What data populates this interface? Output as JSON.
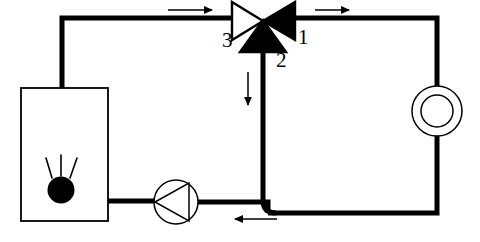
{
  "diagram": {
    "background_color": "#ffffff",
    "line_color": "#000000",
    "pipe_width_px": 5,
    "thin_line_width_px": 1.4,
    "labels": [
      {
        "id": "port-1",
        "text": "1",
        "x": 298,
        "y": 27,
        "meaning": "valve port 1 (supply from circuit)"
      },
      {
        "id": "port-2",
        "text": "2",
        "x": 276,
        "y": 50,
        "meaning": "valve port 2 (bypass / return branch)"
      },
      {
        "id": "port-3",
        "text": "3",
        "x": 222,
        "y": 30,
        "meaning": "valve port 3 (outlet to boiler)"
      }
    ],
    "components": [
      {
        "id": "boiler",
        "name": "boiler",
        "shape": "rectangle",
        "x": 21,
        "y": 88,
        "width": 87,
        "height": 133,
        "fill": "#ffffff",
        "stroke": "#000000",
        "stroke_width": 1.6
      },
      {
        "id": "burner",
        "name": "burner-flame-symbol",
        "shape": "filled-circle-with-rays",
        "cx": 61,
        "cy": 190,
        "r": 13,
        "fill": "#000000",
        "ray_count": 3
      },
      {
        "id": "pump",
        "name": "circulation-pump",
        "shape": "circle-with-triangle",
        "cx": 176,
        "cy": 202,
        "r": 22,
        "fill": "#ffffff",
        "stroke": "#000000",
        "stroke_width": 1.4,
        "triangle_direction": "left"
      },
      {
        "id": "heat-exchanger",
        "name": "heat-exchanger-load",
        "shape": "double-circle",
        "cx": 437,
        "cy": 111,
        "outer_r": 25,
        "inner_r": 16,
        "fill": "#ffffff",
        "stroke": "#000000",
        "stroke_width": 1.4
      },
      {
        "id": "mixing-valve",
        "name": "three-way-mixing-valve",
        "shape": "three-triangles",
        "cx": 263,
        "cy": 21,
        "left_triangle_fill": "#ffffff",
        "right_triangle_fill": "#000000",
        "bottom_triangle_fill": "#000000",
        "stroke": "#000000"
      }
    ],
    "pipes": [
      {
        "id": "boiler-to-top-left",
        "points": "62,88 62,18 238,18",
        "desc": "boiler top outlet up and right to valve port 3"
      },
      {
        "id": "valve-to-right",
        "points": "290,18 437,18 437,86",
        "desc": "valve port 1 right to heat exchanger top"
      },
      {
        "id": "exchanger-to-bottom",
        "points": "437,136 437,213 266,213",
        "desc": "heat exchanger down to bottom return pipe"
      },
      {
        "id": "bypass-branch",
        "points": "263,44 263,200",
        "desc": "valve port 2 bypass down to bottom pipe",
        "elbow": "rounded"
      },
      {
        "id": "pump-to-branch",
        "points": "198,213 266,213",
        "desc": "pump outlet to bottom return junction"
      },
      {
        "id": "boiler-to-pump",
        "points": "108,201 154,201",
        "desc": "boiler bottom outlet to pump inlet"
      }
    ],
    "flow_arrows": [
      {
        "id": "arrow-top-left",
        "direction": "right",
        "x1": 168,
        "y1": 10,
        "x2": 215,
        "y2": 10,
        "style": "thin",
        "desc": "flow toward valve port 3"
      },
      {
        "id": "arrow-top-right",
        "direction": "right",
        "x1": 315,
        "y1": 10,
        "x2": 352,
        "y2": 10,
        "style": "thin",
        "desc": "flow from valve port 1"
      },
      {
        "id": "arrow-branch-down",
        "direction": "down",
        "x1": 248,
        "y1": 72,
        "x2": 248,
        "y2": 108,
        "style": "thin",
        "desc": "bypass flow downward"
      },
      {
        "id": "arrow-bottom",
        "direction": "left",
        "x1": 275,
        "y1": 218,
        "x2": 232,
        "y2": 218,
        "style": "thin",
        "desc": "return flow toward pump"
      }
    ]
  }
}
